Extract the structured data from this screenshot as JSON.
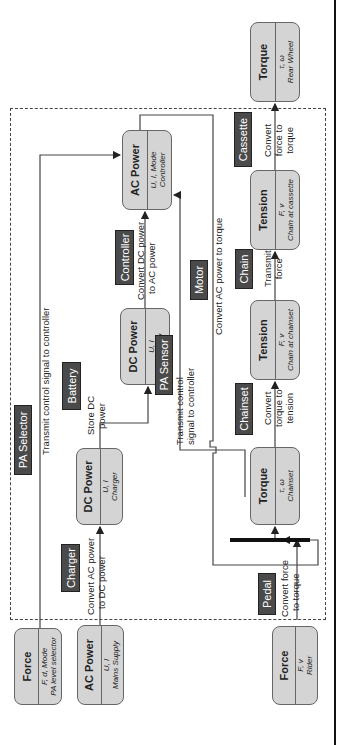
{
  "system_boundary": "dashed",
  "nodes": {
    "force_pa": {
      "title": "Force",
      "vars": "F, d, Mode",
      "name": "PA level selector"
    },
    "ac_mains": {
      "title": "AC Power",
      "vars": "U, I",
      "name": "Mains Supply"
    },
    "force_rider": {
      "title": "Force",
      "vars": "F, v",
      "name": "Rider"
    },
    "dc_charger": {
      "title": "DC Power",
      "vars": "U, I",
      "name": "Charger"
    },
    "dc_battery": {
      "title": "DC Power",
      "vars": "U, I",
      "name": "Battery"
    },
    "ac_controller": {
      "title": "AC Power",
      "vars": "U, I, Mode",
      "name": "Controller"
    },
    "torque_chainset": {
      "title": "Torque",
      "vars": "τ, ω",
      "name": "Chainset"
    },
    "tension_chainset": {
      "title": "Tension",
      "vars": "F, v",
      "name": "Chain at chainset"
    },
    "tension_cassette": {
      "title": "Tension",
      "vars": "F, v",
      "name": "Chain at cassette"
    },
    "torque_wheel": {
      "title": "Torque",
      "vars": "τ, ω",
      "name": "Rear Wheel"
    }
  },
  "components": {
    "pa_selector": "PA Selector",
    "charger": "Charger",
    "battery": "Battery",
    "controller": "Controller",
    "pa_sensor": "PA Sensor",
    "motor": "Motor",
    "pedal": "Pedal",
    "chainset": "Chainset",
    "chain": "Chain",
    "cassette": "Cassette"
  },
  "functions": {
    "pa_selector": "Transmit control signal to controller",
    "charger_1": "Convert AC power",
    "charger_2": "to DC power",
    "battery_1": "Store DC",
    "battery_2": "power",
    "controller_1": "Convert DC power",
    "controller_2": "to AC power",
    "pa_sensor_1": "Transmit control",
    "pa_sensor_2": "signal to controller",
    "motor": "Convert AC power to torque",
    "pedal_1": "Convert force",
    "pedal_2": "to torque",
    "chainset_1": "Convert",
    "chainset_2": "torque to",
    "chainset_3": "tension",
    "chain_1": "Transmit",
    "chain_2": "force",
    "cassette_1": "Convert",
    "cassette_2": "force to",
    "cassette_3": "torque"
  }
}
